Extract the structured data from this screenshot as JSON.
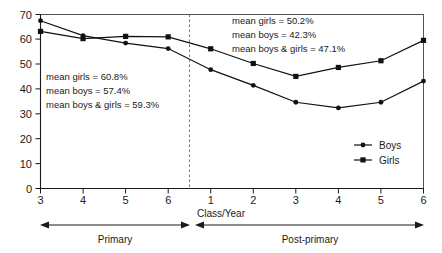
{
  "chart_data": {
    "type": "line",
    "title": "",
    "xlabel": "Class/Year",
    "ylabel": "",
    "ylim": [
      0,
      70
    ],
    "ytick_step": 10,
    "grid": false,
    "legend_position": "bottom-right",
    "categories": [
      "3",
      "4",
      "5",
      "6",
      "1",
      "2",
      "3",
      "4",
      "5",
      "6"
    ],
    "x_tick_labels": [
      "3",
      "4",
      "5",
      "6",
      "1",
      "2",
      "3",
      "4",
      "5",
      "6"
    ],
    "y_tick_labels": [
      "0",
      "10",
      "20",
      "30",
      "40",
      "50",
      "60",
      "70"
    ],
    "series": [
      {
        "name": "Boys",
        "marker": "circle",
        "values": [
          67.5,
          61.5,
          58.5,
          56.3,
          47.8,
          41.5,
          34.7,
          32.4,
          34.7,
          43.2
        ]
      },
      {
        "name": "Girls",
        "marker": "square",
        "values": [
          63.2,
          60.3,
          61.2,
          61.0,
          56.2,
          50.3,
          45.1,
          48.7,
          51.4,
          59.6
        ]
      }
    ],
    "annotations": [
      {
        "id": "primary-means",
        "lines": [
          "mean girls = 60.8%",
          "mean boys = 57.4%",
          "mean boys & girls = 59.3%"
        ]
      },
      {
        "id": "postprimary-means",
        "lines": [
          "mean girls = 50.2%",
          "mean boys = 42.3%",
          "mean boys & girls = 47.1%"
        ]
      }
    ],
    "segment_bands": [
      {
        "id": "primary",
        "label": "Primary"
      },
      {
        "id": "post-primary",
        "label": "Post-primary"
      }
    ],
    "divider": {
      "between": [
        "6",
        "1"
      ],
      "style": "dashed"
    },
    "colors": {
      "series_line": "#111111",
      "marker": "#111111",
      "frame": "#555555",
      "divider": "#777777",
      "text": "#1a1a1a",
      "background": "#ffffff"
    }
  }
}
